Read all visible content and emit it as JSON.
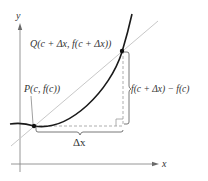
{
  "diagram": {
    "axes": {
      "x_label": "x",
      "y_label": "y"
    },
    "points": {
      "P": {
        "label": "P(c, f(c))"
      },
      "Q": {
        "label": "Q(c + Δx, f(c + Δx))"
      }
    },
    "annotations": {
      "delta_x": "Δx",
      "delta_y": "f(c + Δx) − f(c)"
    },
    "colors": {
      "curve": "#1a1a1a",
      "secant": "#c8c8c8",
      "axes": "#8a8a8a",
      "dashed": "#9a9a9a",
      "text": "#333333"
    }
  }
}
